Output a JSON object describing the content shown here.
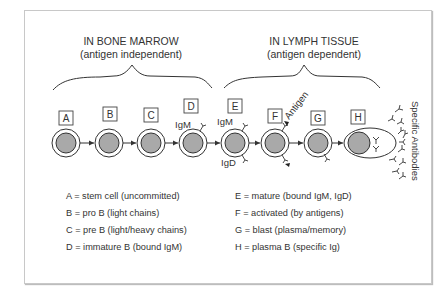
{
  "headers": {
    "bone_marrow": {
      "title": "IN BONE MARROW",
      "subtitle": "(antigen independent)"
    },
    "lymph_tissue": {
      "title": "IN LYMPH TISSUE",
      "subtitle": "(antigen dependent)"
    }
  },
  "stages": [
    {
      "id": "A",
      "label": "A"
    },
    {
      "id": "B",
      "label": "B"
    },
    {
      "id": "C",
      "label": "C"
    },
    {
      "id": "D",
      "label": "D"
    },
    {
      "id": "E",
      "label": "E"
    },
    {
      "id": "F",
      "label": "F"
    },
    {
      "id": "G",
      "label": "G"
    },
    {
      "id": "H",
      "label": "H"
    }
  ],
  "annotations": {
    "d_igm": "IgM",
    "e_igm": "IgM",
    "e_igd": "IgD",
    "antigen": "Antigen",
    "specific_antibodies": "Specific  Antibodies"
  },
  "legend": {
    "left": [
      "A = stem cell (uncommitted)",
      "B = pro B (light chains)",
      "C = pre B (light/heavy chains)",
      "D = immature B (bound IgM)"
    ],
    "right": [
      "E = mature (bound IgM, IgD)",
      "F = activated (by antigens)",
      "G = blast (plasma/memory)",
      "H = plasma B (specific Ig)"
    ]
  },
  "colors": {
    "nucleus": "#a9a9a9",
    "stroke": "#333333",
    "frame": "#c8c8c8"
  }
}
